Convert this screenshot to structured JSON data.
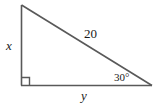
{
  "figure": {
    "background_color": "#ffffff",
    "stroke_color": "#595959",
    "text_color": "#1a1a1a"
  },
  "labels": {
    "vertical_leg": "x",
    "horizontal_leg": "y",
    "hypotenuse": "20",
    "angle": "30°"
  },
  "geometry": {
    "vertices": {
      "top": [
        21,
        5
      ],
      "bottom_left": [
        21,
        85
      ],
      "bottom_right": [
        152,
        85
      ]
    },
    "right_angle_marker": {
      "at": "bottom_left",
      "size": 8
    }
  }
}
